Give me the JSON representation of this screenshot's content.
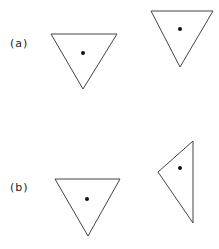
{
  "figure": {
    "rows": [
      {
        "label": "(a)",
        "description": "equilateral triangle, point-down, with center dot; second triangle same orientation"
      },
      {
        "label": "(b)",
        "description": "equilateral triangle, point-down, with center dot; second triangle rotated/skewed"
      }
    ]
  },
  "colors": {
    "stroke": "#444444",
    "dot": "#111111",
    "background": "#ffffff"
  }
}
